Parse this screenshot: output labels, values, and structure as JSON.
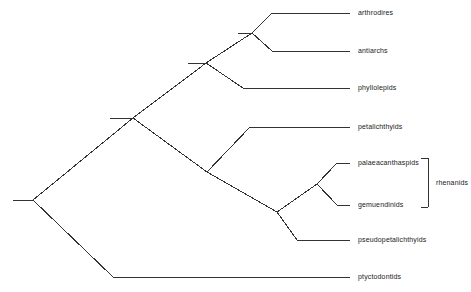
{
  "diagram": {
    "type": "cladogram",
    "title": "",
    "root": {
      "stem_x_start": 13,
      "x": 33,
      "y": 200
    },
    "tip_line_end_x": 350,
    "label_x": 358,
    "taxa": [
      {
        "id": "arthrodires",
        "label": "arthrodires",
        "tip_y": 13,
        "branch_x": 272
      },
      {
        "id": "antiarchs",
        "label": "antiarchs",
        "tip_y": 51,
        "branch_x": 272
      },
      {
        "id": "phyllolepids",
        "label": "phyllolepids",
        "tip_y": 88,
        "branch_x": 243
      },
      {
        "id": "petalichthyids",
        "label": "petalichthyids",
        "tip_y": 127,
        "branch_x": 250
      },
      {
        "id": "palaeacanthaspids",
        "label": "palaeacanthaspids",
        "tip_y": 163,
        "branch_x": 337
      },
      {
        "id": "gemuendinids",
        "label": "gemuendinids",
        "tip_y": 205,
        "branch_x": 337
      },
      {
        "id": "pseudopetalichthyids",
        "label": "pseudopetalichthyids",
        "tip_y": 240,
        "branch_x": 297
      },
      {
        "id": "ptyctodontids",
        "label": "ptyctodontids",
        "tip_y": 277,
        "branch_x": 113
      }
    ],
    "nodes": [
      {
        "id": "node-root",
        "x": 33,
        "y": 200
      },
      {
        "id": "node-placoderms",
        "x": 133,
        "y": 118,
        "stem_x": 110
      },
      {
        "id": "node-arthrodire-clade",
        "x": 206,
        "y": 63,
        "stem_x": 188
      },
      {
        "id": "node-arthrodires-antiarchs",
        "x": 252,
        "y": 33,
        "stem_x": 238
      },
      {
        "id": "node-petalichthyid-clade",
        "x": 207,
        "y": 172
      },
      {
        "id": "node-rhenanid-pseudo",
        "x": 277,
        "y": 212
      },
      {
        "id": "node-rhenanids",
        "x": 317,
        "y": 184
      }
    ],
    "brackets": [
      {
        "id": "rhenanids-bracket",
        "label": "rhenanids",
        "x": 428,
        "y_top": 158,
        "y_bottom": 207,
        "tick_length": 7,
        "label_x": 436,
        "label_y": 183
      }
    ],
    "style": {
      "line_color": "#333333",
      "line_width": 1,
      "text_color": "#1a1a1a",
      "background": "#ffffff"
    }
  }
}
